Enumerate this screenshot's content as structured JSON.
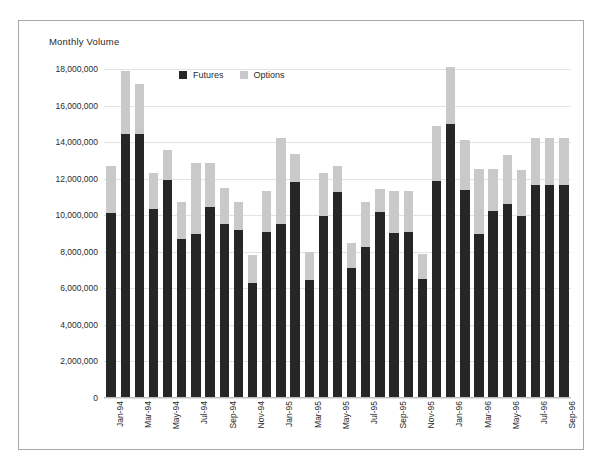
{
  "chart_data": {
    "type": "bar",
    "subtype": "stacked-vertical",
    "title": "Monthly Volume",
    "xlabel": "",
    "ylabel": "Monthly Volume",
    "ylim": [
      0,
      18000000
    ],
    "ytick_values": [
      0,
      2000000,
      4000000,
      6000000,
      8000000,
      10000000,
      12000000,
      14000000,
      16000000,
      18000000
    ],
    "ytick_labels": [
      "0",
      "2,000,000",
      "4,000,000",
      "6,000,000",
      "8,000,000",
      "10,000,000",
      "12,000,000",
      "14,000,000",
      "16,000,000",
      "18,000,000"
    ],
    "grid": true,
    "grid_axis": "y",
    "legend_position": "top-center",
    "legend": [
      "Futures",
      "Options"
    ],
    "colors": {
      "Futures": "#262626",
      "Options": "#c9c9c9"
    },
    "categories": [
      "Jan-94",
      "Feb-94",
      "Mar-94",
      "Apr-94",
      "May-94",
      "Jun-94",
      "Jul-94",
      "Aug-94",
      "Sep-94",
      "Oct-94",
      "Nov-94",
      "Dec-94",
      "Jan-95",
      "Feb-95",
      "Mar-95",
      "Apr-95",
      "May-95",
      "Jun-95",
      "Jul-95",
      "Aug-95",
      "Sep-95",
      "Oct-95",
      "Nov-95",
      "Dec-95",
      "Jan-96",
      "Feb-96",
      "Mar-96",
      "Apr-96",
      "May-96",
      "Jun-96",
      "Jul-96",
      "Aug-96",
      "Sep-96"
    ],
    "xtick_labels_shown": [
      "Jan-94",
      "",
      "Mar-94",
      "",
      "May-94",
      "",
      "Jul-94",
      "",
      "Sep-94",
      "",
      "Nov-94",
      "",
      "Jan-95",
      "",
      "Mar-95",
      "",
      "May-95",
      "",
      "Jul-95",
      "",
      "Sep-95",
      "",
      "Nov-95",
      "",
      "Jan-96",
      "",
      "Mar-96",
      "",
      "May-96",
      "",
      "Jul-96",
      "",
      "Sep-96"
    ],
    "series": [
      {
        "name": "Futures",
        "values": [
          10100000,
          14450000,
          14450000,
          10350000,
          11950000,
          8700000,
          8950000,
          10450000,
          9500000,
          9200000,
          6300000,
          9100000,
          9500000,
          11800000,
          6450000,
          9950000,
          11250000,
          7100000,
          8250000,
          10200000,
          9050000,
          9100000,
          6500000,
          11900000,
          15000000,
          11400000,
          8950000,
          10250000,
          10600000,
          9950000,
          11650000,
          11650000,
          11650000
        ]
      },
      {
        "name": "Options",
        "values": [
          2600000,
          3450000,
          2750000,
          1950000,
          1600000,
          2000000,
          3900000,
          2400000,
          2000000,
          1550000,
          1500000,
          2250000,
          4750000,
          1550000,
          1550000,
          2350000,
          1450000,
          1400000,
          2450000,
          1250000,
          2300000,
          2200000,
          1400000,
          3000000,
          3100000,
          2700000,
          3600000,
          2300000,
          2700000,
          2500000,
          2550000,
          2550000,
          2550000
        ]
      }
    ],
    "totals": [
      12700000,
      17900000,
      17200000,
      12300000,
      13550000,
      10700000,
      12850000,
      12850000,
      11500000,
      10750000,
      7800000,
      11350000,
      14250000,
      13350000,
      8000000,
      12300000,
      12700000,
      8500000,
      10700000,
      11450000,
      11350000,
      11300000,
      7900000,
      14900000,
      18100000,
      14100000,
      12550000,
      12550000,
      13300000,
      12450000,
      14200000,
      14200000,
      14200000
    ]
  }
}
